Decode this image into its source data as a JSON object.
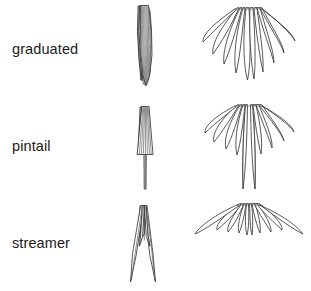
{
  "figure": {
    "background_color": "#ffffff",
    "outline_color": "#3a3a3a",
    "label_color": "#1a1a1a",
    "columns": [
      "closed",
      "spread"
    ],
    "rows": [
      {
        "label": "graduated",
        "closed": {
          "shape_name": "graduated-tail-closed",
          "description": "narrow elongated lens outline, pointed top and bottom, many overlapping feather lines",
          "feather_count": 10
        },
        "spread": {
          "shape_name": "graduated-tail-spread",
          "description": "fan of rounded feathers radiating from top, central feathers longest, outer feathers progressively shorter",
          "feather_count": 11
        }
      },
      {
        "label": "pintail",
        "closed": {
          "shape_name": "pintail-tail-closed",
          "description": "trapezoid widening downward with long thin central spike below",
          "feather_count": 9
        },
        "spread": {
          "shape_name": "pintail-tail-spread",
          "description": "short rounded fan with two long slender central streamers extending far below",
          "feather_count": 11
        }
      },
      {
        "label": "streamer",
        "closed": {
          "shape_name": "streamer-tail-closed",
          "description": "deeply forked inverted V, narrow dark top splitting into two long diverging outer prongs",
          "feather_count": 8
        },
        "spread": {
          "shape_name": "streamer-tail-spread",
          "description": "wide inverted V fan, outer feathers longest sweeping laterally, central feathers short",
          "feather_count": 11
        }
      }
    ]
  }
}
